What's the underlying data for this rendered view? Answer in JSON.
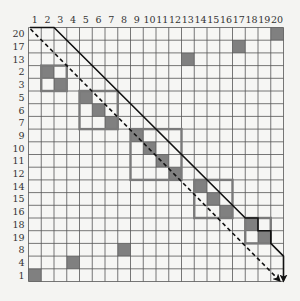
{
  "diagram": {
    "grid": {
      "left": 28.5,
      "top": 27.5,
      "cell_w": 12.75,
      "cell_h": 12.7,
      "size": 20,
      "line_color": "#555555",
      "bg_color": "#f6f6f4",
      "fill_color": "#808080"
    },
    "column_labels": [
      "1",
      "2",
      "3",
      "4",
      "5",
      "6",
      "7",
      "8",
      "9",
      "10",
      "11",
      "12",
      "13",
      "14",
      "15",
      "16",
      "17",
      "18",
      "19",
      "20"
    ],
    "row_labels": [
      "20",
      "17",
      "13",
      "2",
      "3",
      "5",
      "6",
      "7",
      "9",
      "10",
      "11",
      "12",
      "14",
      "15",
      "16",
      "18",
      "19",
      "8",
      "4",
      "1"
    ],
    "filled_cells": [
      {
        "row": 0,
        "col": 20
      },
      {
        "row": 1,
        "col": 17
      },
      {
        "row": 2,
        "col": 13
      },
      {
        "row": 3,
        "col": 2
      },
      {
        "row": 4,
        "col": 3
      },
      {
        "row": 5,
        "col": 5
      },
      {
        "row": 6,
        "col": 6
      },
      {
        "row": 7,
        "col": 7
      },
      {
        "row": 8,
        "col": 9
      },
      {
        "row": 9,
        "col": 10
      },
      {
        "row": 10,
        "col": 11
      },
      {
        "row": 11,
        "col": 12
      },
      {
        "row": 12,
        "col": 14
      },
      {
        "row": 13,
        "col": 15
      },
      {
        "row": 14,
        "col": 16
      },
      {
        "row": 15,
        "col": 18
      },
      {
        "row": 16,
        "col": 19
      },
      {
        "row": 17,
        "col": 8
      },
      {
        "row": 18,
        "col": 4
      },
      {
        "row": 19,
        "col": 1
      }
    ],
    "blocks": [
      {
        "name": "block-2-3",
        "row_start": 3,
        "col_start": 2,
        "size": 2
      },
      {
        "name": "block-5-7",
        "row_start": 5,
        "col_start": 5,
        "size": 3
      },
      {
        "name": "block-9-12",
        "row_start": 8,
        "col_start": 9,
        "size": 4
      },
      {
        "name": "block-14-16",
        "row_start": 12,
        "col_start": 14,
        "size": 3
      },
      {
        "name": "block-18-19",
        "row_start": 15,
        "col_start": 18,
        "size": 2
      }
    ],
    "solid_path_label": "block-diagonal path",
    "dashed_path_label": "main diagonal path"
  }
}
